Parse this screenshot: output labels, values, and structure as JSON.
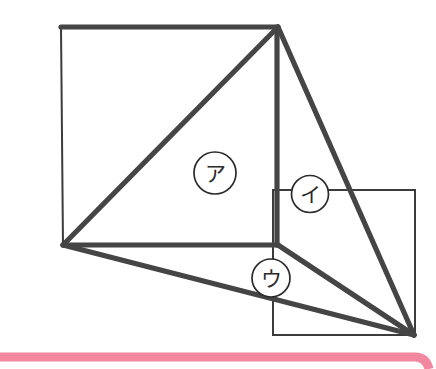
{
  "canvas": {
    "width": 436,
    "height": 369,
    "background_color": "#ffffff"
  },
  "figure": {
    "line_color": "#454545",
    "thin_line_color": "#3c3c3c",
    "accent_color": "#f2889f",
    "square": {
      "name": "large-square",
      "points": "61,27 278,27 278,245 63,245"
    },
    "rectangle": {
      "name": "right-rectangle",
      "points": "273,190 415,190 415,335 273,335"
    },
    "thick_segments": [
      {
        "name": "apex-to-bottom-left-diagonal",
        "path": "M 278,27 L 63,245"
      },
      {
        "name": "apex-vertical-to-square-base",
        "path": "M 277,27 L 277,245"
      },
      {
        "name": "square-top-edge-thick",
        "path": "M 61,27 L 278,27"
      },
      {
        "name": "square-bottom-edge-thick",
        "path": "M 63,245 L 278,245"
      },
      {
        "name": "apex-to-far-right-diagonal",
        "path": "M 278,27 L 414,335"
      },
      {
        "name": "bottom-left-to-far-right-diagonal",
        "path": "M 63,245 L 414,335"
      },
      {
        "name": "square-corner-to-far-right-diagonal",
        "path": "M 278,245 L 414,335"
      }
    ],
    "accent_band": {
      "name": "pink-highlight-band",
      "path": "M -6,357 L 415,357 Q 426,357 429,369"
    }
  },
  "region_labels": [
    {
      "name": "region-label-a",
      "text": "ア",
      "cx": 215,
      "cy": 173,
      "r": 21
    },
    {
      "name": "region-label-i",
      "text": "イ",
      "cx": 310,
      "cy": 194,
      "r": 18.5
    },
    {
      "name": "region-label-u",
      "text": "ウ",
      "cx": 271,
      "cy": 278,
      "r": 19
    }
  ]
}
